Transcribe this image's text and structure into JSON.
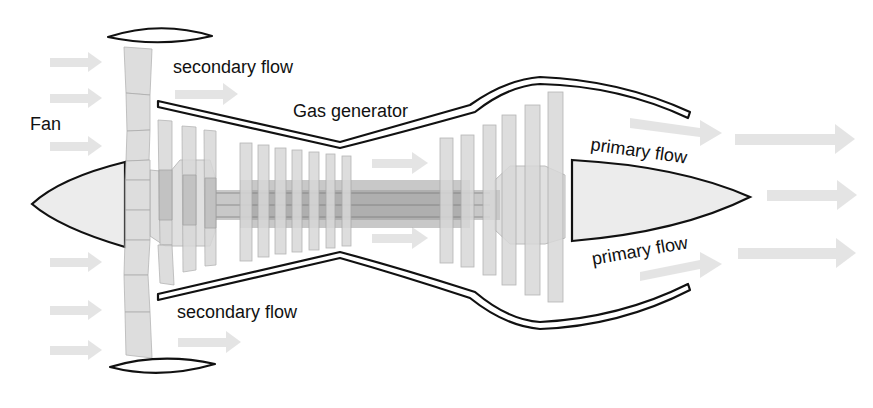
{
  "labels": {
    "fan": "Fan",
    "gas_generator": "Gas generator",
    "secondary_flow_top": "secondary flow",
    "secondary_flow_bottom": "secondary flow",
    "primary_flow_top": "primary flow",
    "primary_flow_bottom": "primary flow"
  },
  "colors": {
    "outline": "#111111",
    "blade": "#d8d8d8",
    "arrow": "#e3e3e3",
    "background": "#ffffff"
  },
  "components": [
    "nose cone",
    "fan blades",
    "low-pressure compressor",
    "high-pressure compressor",
    "shaft",
    "turbine",
    "exhaust cone",
    "fan cowl",
    "core casing"
  ]
}
